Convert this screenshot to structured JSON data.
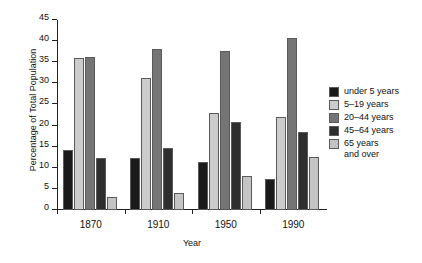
{
  "chart_data": {
    "type": "bar",
    "title": "",
    "xlabel": "Year",
    "ylabel": "Percentage of Total Population",
    "categories": [
      "1870",
      "1910",
      "1950",
      "1990"
    ],
    "ylim": [
      0,
      45
    ],
    "yticks": [
      0,
      5,
      10,
      15,
      20,
      25,
      30,
      35,
      40,
      45
    ],
    "grid": false,
    "legend_position": "right",
    "series": [
      {
        "name": "under 5 years",
        "color": "#1a1a1a",
        "values": [
          14.2,
          12.3,
          11.4,
          7.4
        ]
      },
      {
        "name": "5–19 years",
        "color": "#cccccc",
        "values": [
          36.1,
          31.3,
          23.0,
          22.0
        ]
      },
      {
        "name": "20–44 years",
        "color": "#757575",
        "values": [
          36.2,
          38.2,
          37.7,
          40.8
        ]
      },
      {
        "name": "45–64 years",
        "color": "#2e2e2e",
        "values": [
          12.3,
          14.6,
          20.8,
          18.4
        ]
      },
      {
        "name": "65 years\nand over",
        "color": "#c4c4c4",
        "values": [
          3.0,
          4.0,
          8.1,
          12.6
        ]
      }
    ]
  }
}
